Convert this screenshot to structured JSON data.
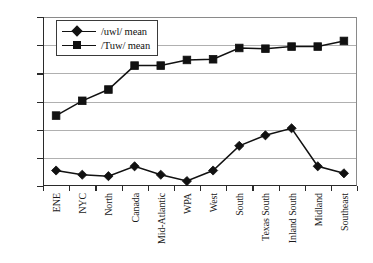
{
  "chart_data": {
    "type": "line",
    "title": "",
    "xlabel": "",
    "ylabel": "",
    "ylim": [
      800,
      2000
    ],
    "ytick_step": 200,
    "yticks": [
      800,
      1000,
      1200,
      1400,
      1600,
      1800,
      2000
    ],
    "grid": true,
    "legend_position": "top-left",
    "categories": [
      "ENE",
      "NYC",
      "North",
      "Canada",
      "Mid-Atlantic",
      "WPA",
      "West",
      "South",
      "Texas South",
      "Inland South",
      "Midland",
      "Southeast"
    ],
    "series": [
      {
        "name": "/uwl/ mean",
        "marker": "diamond",
        "color": "#111111",
        "values": [
          910,
          880,
          870,
          940,
          880,
          835,
          910,
          1085,
          1160,
          1210,
          940,
          890
        ]
      },
      {
        "name": "/Tuw/ mean",
        "marker": "square",
        "color": "#111111",
        "values": [
          1300,
          1405,
          1485,
          1655,
          1655,
          1695,
          1700,
          1780,
          1775,
          1790,
          1790,
          1830
        ]
      }
    ]
  },
  "legend": {
    "items": [
      {
        "label": "/uwl/ mean",
        "marker": "diamond"
      },
      {
        "label": "/Tuw/ mean",
        "marker": "square"
      }
    ]
  }
}
